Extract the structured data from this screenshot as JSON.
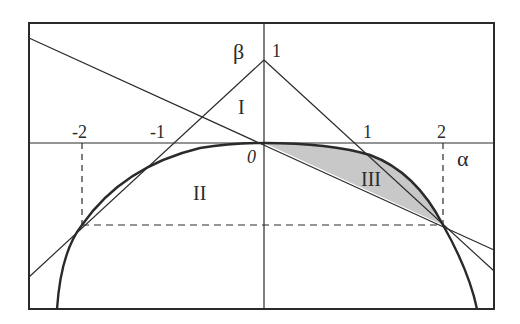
{
  "diagram": {
    "axes": {
      "x_label": "α",
      "y_label": "β",
      "origin_label": "0",
      "x_ticks": [
        "-2",
        "-1",
        "1",
        "2"
      ],
      "y_ticks": [
        "1"
      ]
    },
    "regions": {
      "region_1": "I",
      "region_2": "II",
      "region_3": "III"
    },
    "colors": {
      "line": "#2a2a2a",
      "shade": "#c8c8c8",
      "background": "#ffffff"
    }
  }
}
